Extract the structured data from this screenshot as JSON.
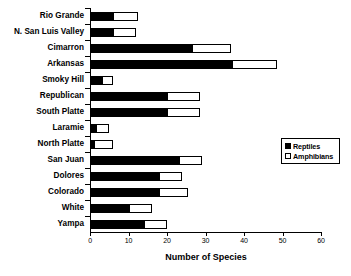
{
  "chart_data": {
    "type": "bar",
    "orientation": "horizontal",
    "stacked": true,
    "title": "",
    "xlabel": "Number of Species",
    "ylabel": "",
    "xlim": [
      0,
      60
    ],
    "xticks": [
      0,
      10,
      20,
      30,
      40,
      50,
      60
    ],
    "xtick_labels": [
      "0",
      "10",
      "20",
      "30",
      "40",
      "50",
      "60"
    ],
    "grid": false,
    "legend_position": "center-right",
    "categories": [
      "Rio Grande",
      "N. San Luis Valley",
      "Cimarron",
      "Arkansas",
      "Smoky Hill",
      "Republican",
      "South Platte",
      "Laramie",
      "North Platte",
      "San Juan",
      "Dolores",
      "Colorado",
      "White",
      "Yampa"
    ],
    "series": [
      {
        "name": "Reptiles",
        "color": "#000000",
        "values": [
          6,
          6,
          26.5,
          37,
          3,
          20,
          20,
          1.5,
          1,
          23,
          18,
          18,
          10,
          14
        ]
      },
      {
        "name": "Amphibians",
        "color": "#ffffff",
        "values": [
          6.5,
          6,
          10,
          11.5,
          3,
          8.5,
          8.5,
          3.5,
          5,
          6,
          6,
          7.5,
          6,
          6
        ]
      }
    ],
    "totals": [
      12.5,
      12,
      36.5,
      48.5,
      6,
      28.5,
      28.5,
      5,
      6,
      29,
      24,
      25.5,
      16,
      20
    ]
  },
  "legend": {
    "items": [
      {
        "label": "Reptiles",
        "swatch": "filled-black-square"
      },
      {
        "label": "Amphibians",
        "swatch": "open-white-square"
      }
    ]
  },
  "axis": {
    "x_title": "Number of Species"
  }
}
